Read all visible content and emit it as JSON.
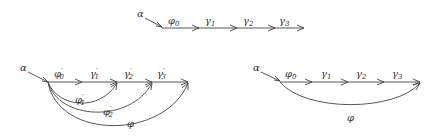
{
  "diagrams": {
    "top": {
      "source": "α",
      "edges": [
        {
          "base": "φ",
          "sub": "0",
          "prime": ""
        },
        {
          "base": "γ",
          "sub": "1",
          "prime": ""
        },
        {
          "base": "γ",
          "sub": "2",
          "prime": ""
        },
        {
          "base": "γ",
          "sub": "3",
          "prime": ""
        }
      ]
    },
    "bottom_left": {
      "source": "α",
      "edges": [
        {
          "base": "φ",
          "sub": "0",
          "prime": "′"
        },
        {
          "base": "γ",
          "sub": "1",
          "prime": "′"
        },
        {
          "base": "γ",
          "sub": "2",
          "prime": "′"
        },
        {
          "base": "γ",
          "sub": "3",
          "prime": "′"
        }
      ],
      "curves": [
        {
          "base": "φ",
          "sub": "1",
          "prime": "′"
        },
        {
          "base": "φ",
          "sub": "2",
          "prime": "′"
        },
        {
          "base": "φ",
          "sub": "",
          "prime": ""
        }
      ]
    },
    "bottom_right": {
      "source": "α",
      "edges": [
        {
          "base": "φ",
          "sub": "0",
          "prime": ""
        },
        {
          "base": "γ",
          "sub": "1",
          "prime": ""
        },
        {
          "base": "γ",
          "sub": "2",
          "prime": ""
        },
        {
          "base": "γ",
          "sub": "3",
          "prime": ""
        }
      ],
      "curves": [
        {
          "base": "φ",
          "sub": "",
          "prime": ""
        }
      ]
    }
  }
}
